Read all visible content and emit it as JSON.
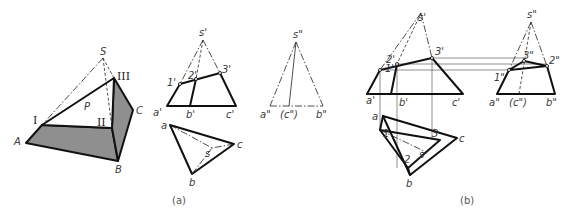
{
  "figure": {
    "colors": {
      "line": "#111111",
      "shade": "#8f8f8f",
      "background": "#ffffff",
      "label": "#3a3a3a"
    }
  },
  "panel_a": {
    "caption": "(a)",
    "isometric": {
      "labels": {
        "S": "S",
        "I": "I",
        "II": "II",
        "III": "III",
        "A": "A",
        "B": "B",
        "C": "C",
        "P": "P"
      }
    },
    "front_view": {
      "labels": {
        "s": "s'",
        "p1": "1'",
        "p2": "2'",
        "p3": "3'",
        "a": "a'",
        "b": "b'",
        "c": "c'"
      }
    },
    "top_view": {
      "labels": {
        "a": "a",
        "b": "b",
        "c": "c",
        "s": "s"
      }
    },
    "side_view": {
      "labels": {
        "s": "s\"",
        "a": "a\"",
        "c": "(c\")",
        "b": "b\""
      }
    }
  },
  "panel_b": {
    "caption": "(b)",
    "front_view": {
      "labels": {
        "s": "s'",
        "p1": "1'",
        "p2": "2'",
        "p3": "3'",
        "a": "a'",
        "b": "b'",
        "c": "c'"
      }
    },
    "top_view": {
      "labels": {
        "a": "a",
        "b": "b",
        "c": "c",
        "s": "s",
        "p1": "1",
        "p2": "2",
        "p3": "3"
      }
    },
    "side_view": {
      "labels": {
        "s": "s\"",
        "p1": "1\"",
        "p2": "2\"",
        "p3": "3\"",
        "a": "a\"",
        "c": "(c\")",
        "b": "b\""
      }
    }
  }
}
